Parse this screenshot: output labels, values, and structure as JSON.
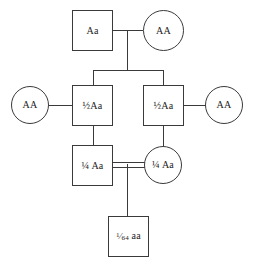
{
  "diagram": {
    "type": "pedigree",
    "colors": {
      "stroke": "#3a3a3a",
      "text": "#1c1c1c",
      "background": "#ffffff"
    },
    "generations": [
      {
        "id": "generation-1",
        "nodes": [
          {
            "id": "g1-father",
            "shape": "square",
            "sex": "male",
            "label": "Aa"
          },
          {
            "id": "g1-mother",
            "shape": "circle",
            "sex": "female",
            "label": "AA"
          }
        ]
      },
      {
        "id": "generation-2",
        "nodes": [
          {
            "id": "g2-spouse-left",
            "shape": "circle",
            "sex": "female",
            "label": "AA"
          },
          {
            "id": "g2-son-left",
            "shape": "square",
            "sex": "male",
            "label": "½Aa"
          },
          {
            "id": "g2-son-right",
            "shape": "square",
            "sex": "male",
            "label": "½Aa"
          },
          {
            "id": "g2-spouse-right",
            "shape": "circle",
            "sex": "female",
            "label": "AA"
          }
        ]
      },
      {
        "id": "generation-3",
        "nodes": [
          {
            "id": "g3-cousin-male",
            "shape": "square",
            "sex": "male",
            "label": "¼ Aa"
          },
          {
            "id": "g3-cousin-female",
            "shape": "circle",
            "sex": "female",
            "label": "¼ Aa"
          }
        ],
        "mating": "consanguineous-double-line"
      },
      {
        "id": "generation-4",
        "nodes": [
          {
            "id": "g4-child",
            "shape": "square",
            "sex": "male",
            "label": "1/64 aa",
            "fraction_numerator": "1",
            "fraction_solidus": "⁄",
            "fraction_denominator": "64",
            "genotype": " aa"
          }
        ]
      }
    ]
  }
}
